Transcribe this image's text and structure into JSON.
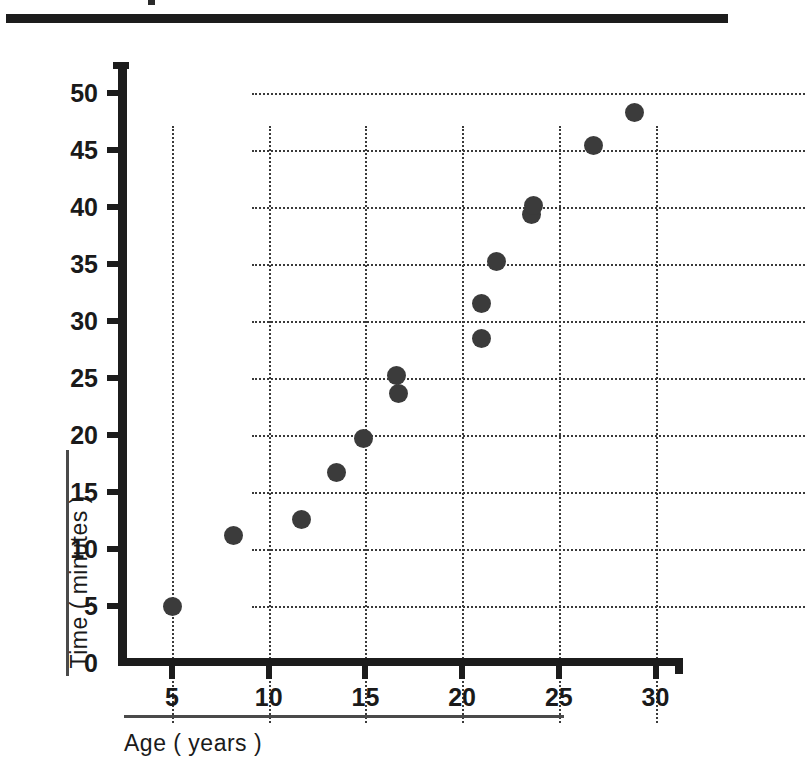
{
  "figure": {
    "kind": "scatter-plot",
    "background_color": "#ffffff",
    "ink_color": "#1c1c1c",
    "marker_color": "#3b3b3b"
  },
  "axis_titles": {
    "x": "Age ( years )",
    "y": "Time ( minutes )"
  },
  "ticks": {
    "x": [
      "5",
      "10",
      "15",
      "20",
      "25",
      "30"
    ],
    "y": [
      "0",
      "5",
      "10",
      "15",
      "20",
      "25",
      "30",
      "35",
      "40",
      "45",
      "50"
    ]
  },
  "chart_data": {
    "type": "scatter",
    "title": "",
    "xlabel": "Age ( years )",
    "ylabel": "Time ( minutes )",
    "xlim": [
      3.2,
      31.9
    ],
    "ylim": [
      0,
      52.5
    ],
    "xticks": [
      5,
      10,
      15,
      20,
      25,
      30
    ],
    "yticks": [
      0,
      5,
      10,
      15,
      20,
      25,
      30,
      35,
      40,
      45,
      50
    ],
    "grid": true,
    "grid_style": "dotted",
    "legend": null,
    "marker": "filled-circle",
    "points": [
      {
        "x": 5.0,
        "y": 5.0
      },
      {
        "x": 8.2,
        "y": 11.2
      },
      {
        "x": 11.7,
        "y": 12.6
      },
      {
        "x": 13.5,
        "y": 16.7
      },
      {
        "x": 14.9,
        "y": 19.7
      },
      {
        "x": 16.6,
        "y": 25.2
      },
      {
        "x": 16.7,
        "y": 23.6
      },
      {
        "x": 21.0,
        "y": 28.5
      },
      {
        "x": 21.0,
        "y": 31.5
      },
      {
        "x": 21.8,
        "y": 35.2
      },
      {
        "x": 23.6,
        "y": 39.3
      },
      {
        "x": 23.7,
        "y": 40.1
      },
      {
        "x": 26.8,
        "y": 45.4
      },
      {
        "x": 28.9,
        "y": 48.3
      }
    ]
  }
}
